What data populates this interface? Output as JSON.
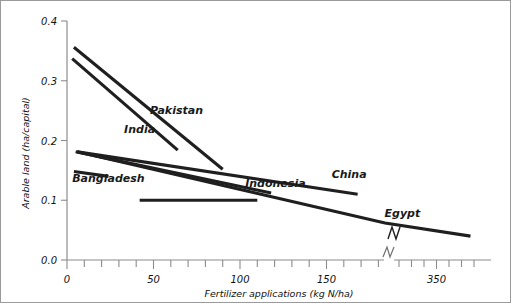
{
  "chart_data": {
    "type": "line",
    "title": "",
    "xlabel": "Fertilizer applications (kg N/ha)",
    "ylabel": "Arable land (ha/capital)",
    "xlim": [
      0,
      400
    ],
    "ylim": [
      0.0,
      0.4
    ],
    "grid": false,
    "legend_position": "inline-labels",
    "axis_break": {
      "axis": "x",
      "after": 200,
      "resume": 300,
      "symbol": "zigzag"
    },
    "x_tick_labels": [
      "0",
      "50",
      "100",
      "150",
      "350"
    ],
    "x_tick_values": [
      0,
      50,
      100,
      150,
      350
    ],
    "x_minor_tick_step": 10,
    "y_tick_labels": [
      "0.0",
      "0.1",
      "0.2",
      "0.3",
      "0.4"
    ],
    "y_tick_values": [
      0.0,
      0.1,
      0.2,
      0.3,
      0.4
    ],
    "series": [
      {
        "name": "Pakistan",
        "label": "Pakistan",
        "points": [
          [
            4,
            0.356
          ],
          [
            90,
            0.152
          ]
        ],
        "label_position": [
          48,
          0.245
        ]
      },
      {
        "name": "India",
        "label": "India",
        "points": [
          [
            3,
            0.337
          ],
          [
            64,
            0.184
          ]
        ],
        "label_position": [
          33,
          0.212
        ]
      },
      {
        "name": "Bangladesh",
        "label": "Bangladesh",
        "points": [
          [
            4,
            0.148
          ],
          [
            24,
            0.14
          ]
        ],
        "label_position": [
          3,
          0.131
        ]
      },
      {
        "name": "Indonesia",
        "label": "Indonesia",
        "points": [
          [
            42,
            0.1
          ],
          [
            110,
            0.1
          ]
        ],
        "label_position": [
          103,
          0.122
        ]
      },
      {
        "name": "China",
        "label": "China",
        "points": [
          [
            6,
            0.181
          ],
          [
            168,
            0.11
          ]
        ],
        "label_position": [
          153,
          0.137
        ]
      },
      {
        "name": "Egypt",
        "label": "Egypt",
        "points": [
          [
            6,
            0.181
          ],
          [
            210,
            0.062
          ],
          [
            390,
            0.04
          ]
        ],
        "label_position": [
          205,
          0.072
        ]
      }
    ],
    "extra_segments": [
      {
        "name": "mid-declining-line",
        "points": [
          [
            5,
            0.181
          ],
          [
            118,
            0.112
          ]
        ]
      }
    ]
  }
}
